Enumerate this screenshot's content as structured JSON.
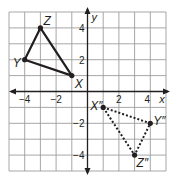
{
  "diagram": {
    "type": "coordinate-plane",
    "grid": {
      "xmin": -5,
      "xmax": 5,
      "ymin": -5,
      "ymax": 5,
      "step": 1
    },
    "axes": {
      "x_label": "x",
      "y_label": "y"
    },
    "ticks": {
      "x": [
        {
          "value": -4,
          "label": "−4"
        },
        {
          "value": -2,
          "label": "−2"
        },
        {
          "value": 2,
          "label": "2"
        },
        {
          "value": 4,
          "label": "4"
        }
      ],
      "y": [
        {
          "value": 4,
          "label": "4"
        },
        {
          "value": 2,
          "label": "2"
        },
        {
          "value": -2,
          "label": "−2"
        },
        {
          "value": -4,
          "label": "−4"
        }
      ]
    },
    "figures": [
      {
        "name": "triangle-XYZ",
        "style": "solid",
        "vertices": [
          {
            "name": "X",
            "label": "X",
            "x": -1,
            "y": 1
          },
          {
            "name": "Y",
            "label": "Y",
            "x": -4,
            "y": 2
          },
          {
            "name": "Z",
            "label": "Z",
            "x": -3,
            "y": 4
          }
        ]
      },
      {
        "name": "triangle-XYZ-double-prime",
        "style": "dotted",
        "vertices": [
          {
            "name": "X''",
            "label": "X″",
            "x": 1,
            "y": -1
          },
          {
            "name": "Y''",
            "label": "Y″",
            "x": 4,
            "y": -2
          },
          {
            "name": "Z''",
            "label": "Z″",
            "x": 3,
            "y": -4
          }
        ]
      }
    ],
    "colors": {
      "grid": "#9d9d9d",
      "ink": "#231f20",
      "background": "#ffffff"
    }
  }
}
